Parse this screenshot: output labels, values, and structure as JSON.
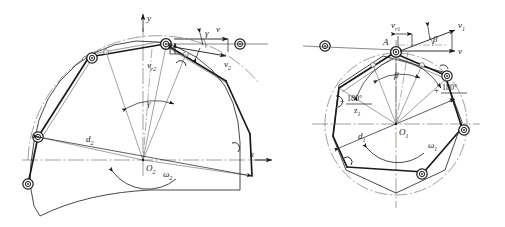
{
  "figure": {
    "kind": "engineering-line-drawing",
    "background_color": "#ffffff",
    "line_color": "#1a1a1a",
    "thin_line_color": "#555555",
    "centerline_color": "#777777"
  },
  "left_diagram": {
    "name": "driven-sprocket",
    "center_label": "O",
    "center_sub": "2",
    "angular_velocity_label": "ω",
    "angular_velocity_sub": "2",
    "pitch_diameter_label": "d",
    "pitch_diameter_sub": "2",
    "axis_x_label": "x",
    "axis_y_label": "y",
    "angle_label": "γ",
    "velocity_chain_label": "v",
    "velocity_tangential_label": "v",
    "velocity_tangential_sub": "2",
    "velocity_radial_label": "v",
    "velocity_radial_sub": "r2"
  },
  "right_diagram": {
    "name": "driving-sprocket",
    "center_label": "O",
    "center_sub": "1",
    "angular_velocity_label": "ω",
    "angular_velocity_sub": "1",
    "pitch_diameter_label": "d",
    "pitch_diameter_sub": "1",
    "contact_point_label": "A",
    "angle_label": "β",
    "angle_label_upper": "β",
    "velocity_chain_label": "v",
    "velocity_tangential_label": "v",
    "velocity_tangential_sub": "1",
    "velocity_radial_label": "v",
    "velocity_radial_sub": "r1",
    "half_pitch_angle_numerator": "180°",
    "half_pitch_angle_denominator": "z",
    "half_pitch_angle_denominator_sub": "1",
    "half_pitch_angle_sign_left": "−",
    "half_pitch_angle_sign_right": "+"
  }
}
